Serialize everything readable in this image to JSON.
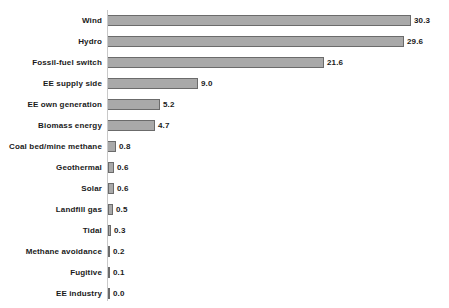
{
  "chart_data": {
    "type": "bar",
    "orientation": "horizontal",
    "title": "",
    "subtitle": "",
    "xlabel": "",
    "ylabel": "",
    "legend": [],
    "grid": false,
    "xlim": [
      0,
      34
    ],
    "categories": [
      "Wind",
      "Hydro",
      "Fossil-fuel switch",
      "EE supply side",
      "EE own generation",
      "Biomass energy",
      "Coal bed/mine methane",
      "Geothermal",
      "Solar",
      "Landfill gas",
      "Tidal",
      "Methane avoidance",
      "Fugitive",
      "EE industry"
    ],
    "values": [
      30.3,
      29.6,
      21.6,
      9.0,
      5.2,
      4.7,
      0.8,
      0.6,
      0.6,
      0.5,
      0.3,
      0.2,
      0.1,
      0.0
    ],
    "value_labels": [
      "30.3",
      "29.6",
      "21.6",
      "9.0",
      "5.2",
      "4.7",
      "0.8",
      "0.6",
      "0.6",
      "0.5",
      "0.3",
      "0.2",
      "0.1",
      "0.0"
    ],
    "colors": {
      "bar_fill": "#a9a9a9",
      "bar_edge": "#6b6b6b",
      "axis_line": "#c9c9c9",
      "text": "#1a1a1a",
      "background": "#ffffff"
    }
  }
}
